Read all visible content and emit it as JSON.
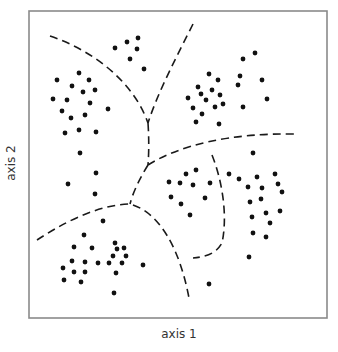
{
  "diagram": {
    "type": "clustering-decision-regions",
    "x_axis_label": "axis 1",
    "y_axis_label": "axis 2",
    "frame": {
      "x0": 29,
      "y0": 11,
      "x1": 327,
      "y1": 318
    },
    "colors": {
      "dots": "#111111",
      "boundaries": "#1a1a1a",
      "frame": "#8a8a8a"
    },
    "boundaries": [
      {
        "name": "upper-left-arc",
        "path": "M50,36 C85,48 118,70 138,102 C144,112 146,118 148,123"
      },
      {
        "name": "upper-right-arc",
        "path": "M193,24 C176,58 158,92 148,123"
      },
      {
        "name": "center-trunk",
        "path": "M148,123 C149,138 149,152 148,165"
      },
      {
        "name": "right-horizontal-arc",
        "path": "M148,165 C180,145 230,133 295,134"
      },
      {
        "name": "center-lower-stem",
        "path": "M148,165 C140,178 133,192 130,204"
      },
      {
        "name": "bottom-left-arc",
        "path": "M37,240 C60,225 95,205 130,204 C160,212 180,250 189,298"
      },
      {
        "name": "inner-right-arc",
        "path": "M212,155 C222,180 228,215 222,243 C216,254 205,257 193,258"
      }
    ],
    "clusters": [
      {
        "name": "top-small",
        "points": [
          [
            115,
            48
          ],
          [
            127,
            42
          ],
          [
            138,
            38
          ],
          [
            137,
            49
          ],
          [
            130,
            59
          ],
          [
            144,
            69
          ]
        ]
      },
      {
        "name": "left-upper",
        "points": [
          [
            57,
            80
          ],
          [
            79,
            73
          ],
          [
            89,
            80
          ],
          [
            72,
            86
          ],
          [
            83,
            92
          ],
          [
            95,
            90
          ],
          [
            53,
            99
          ],
          [
            67,
            100
          ],
          [
            90,
            103
          ],
          [
            108,
            109
          ],
          [
            62,
            111
          ],
          [
            85,
            115
          ],
          [
            71,
            118
          ],
          [
            65,
            133
          ],
          [
            79,
            130
          ],
          [
            96,
            132
          ],
          [
            80,
            153
          ],
          [
            96,
            173
          ],
          [
            68,
            184
          ],
          [
            95,
            194
          ]
        ]
      },
      {
        "name": "right-upper",
        "points": [
          [
            255,
            53
          ],
          [
            243,
            59
          ],
          [
            209,
            74
          ],
          [
            218,
            80
          ],
          [
            240,
            76
          ],
          [
            238,
            85
          ],
          [
            262,
            80
          ],
          [
            198,
            87
          ],
          [
            212,
            90
          ],
          [
            201,
            94
          ],
          [
            220,
            95
          ],
          [
            188,
            98
          ],
          [
            206,
            100
          ],
          [
            267,
            99
          ],
          [
            223,
            104
          ],
          [
            215,
            107
          ],
          [
            193,
            108
          ],
          [
            243,
            107
          ],
          [
            202,
            114
          ],
          [
            196,
            122
          ],
          [
            219,
            124
          ],
          [
            253,
            153
          ]
        ]
      },
      {
        "name": "center-right",
        "points": [
          [
            196,
            170
          ],
          [
            186,
            174
          ],
          [
            169,
            182
          ],
          [
            180,
            183
          ],
          [
            193,
            185
          ],
          [
            210,
            183
          ],
          [
            171,
            197
          ],
          [
            205,
            198
          ],
          [
            181,
            204
          ],
          [
            190,
            215
          ]
        ]
      },
      {
        "name": "far-right",
        "points": [
          [
            229,
            174
          ],
          [
            239,
            179
          ],
          [
            257,
            177
          ],
          [
            275,
            174
          ],
          [
            248,
            187
          ],
          [
            262,
            188
          ],
          [
            278,
            184
          ],
          [
            282,
            192
          ],
          [
            250,
            202
          ],
          [
            261,
            199
          ],
          [
            280,
            211
          ],
          [
            252,
            217
          ],
          [
            266,
            213
          ],
          [
            270,
            223
          ],
          [
            253,
            233
          ],
          [
            266,
            237
          ],
          [
            249,
            257
          ],
          [
            209,
            284
          ]
        ]
      },
      {
        "name": "bottom-left",
        "points": [
          [
            103,
            221
          ],
          [
            84,
            235
          ],
          [
            74,
            247
          ],
          [
            92,
            248
          ],
          [
            115,
            243
          ],
          [
            117,
            249
          ],
          [
            124,
            248
          ],
          [
            113,
            256
          ],
          [
            126,
            256
          ],
          [
            72,
            261
          ],
          [
            85,
            262
          ],
          [
            98,
            263
          ],
          [
            109,
            263
          ],
          [
            122,
            263
          ],
          [
            63,
            268
          ],
          [
            74,
            272
          ],
          [
            85,
            272
          ],
          [
            116,
            273
          ],
          [
            143,
            265
          ],
          [
            64,
            280
          ],
          [
            81,
            282
          ],
          [
            114,
            293
          ]
        ]
      }
    ]
  }
}
